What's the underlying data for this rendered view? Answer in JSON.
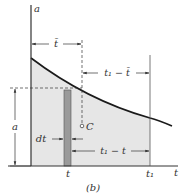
{
  "figure": {
    "caption": "(b)",
    "axes": {
      "y_label": "a",
      "x_label": "t"
    },
    "labels": {
      "t_bar": "t̄",
      "t1_minus_tbar": "t₁ − t̄",
      "a_value": "a",
      "dt": "dt",
      "centroid": "C",
      "t1_minus_t": "t₁ − t",
      "t_tick": "t",
      "t1_tick": "t₁"
    },
    "colors": {
      "area_fill": "#e6e6e6",
      "strip_fill": "#9a9a9a",
      "lines": "#333333",
      "curve": "#1a1a1a"
    }
  }
}
